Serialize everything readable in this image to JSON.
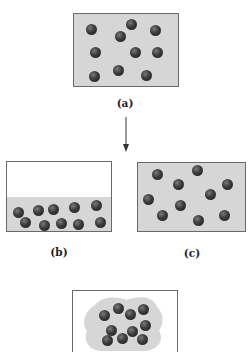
{
  "panels": [
    {
      "id": "a",
      "label": "(a)",
      "state": "gas filling container",
      "box": [
        73,
        13,
        106,
        74
      ],
      "fill": "full",
      "balls": [
        [
          91,
          29
        ],
        [
          131,
          24
        ],
        [
          120,
          36
        ],
        [
          155,
          30
        ],
        [
          95,
          52
        ],
        [
          135,
          52
        ],
        [
          157,
          52
        ],
        [
          94,
          76
        ],
        [
          118,
          70
        ],
        [
          146,
          75
        ]
      ]
    },
    {
      "id": "b",
      "label": "(b)",
      "state": "liquid at bottom of container",
      "box": [
        6,
        161,
        106,
        71
      ],
      "fill": "bottom",
      "fill_top": 196,
      "balls": [
        [
          18,
          212
        ],
        [
          38,
          210
        ],
        [
          53,
          209
        ],
        [
          74,
          207
        ],
        [
          96,
          205
        ],
        [
          25,
          222
        ],
        [
          44,
          225
        ],
        [
          61,
          223
        ],
        [
          78,
          224
        ],
        [
          100,
          222
        ]
      ]
    },
    {
      "id": "c",
      "label": "(c)",
      "state": "gas filling container",
      "box": [
        137,
        162,
        109,
        70
      ],
      "fill": "full",
      "balls": [
        [
          157,
          174
        ],
        [
          197,
          170
        ],
        [
          178,
          184
        ],
        [
          227,
          184
        ],
        [
          148,
          199
        ],
        [
          210,
          194
        ],
        [
          180,
          205
        ],
        [
          162,
          215
        ],
        [
          198,
          220
        ],
        [
          224,
          215
        ]
      ]
    },
    {
      "id": "d",
      "label": "",
      "state": "solid clustered",
      "box": [
        72,
        290,
        106,
        62
      ],
      "fill": "blob",
      "balls": [
        [
          104,
          315
        ],
        [
          118,
          308
        ],
        [
          130,
          314
        ],
        [
          143,
          309
        ],
        [
          111,
          330
        ],
        [
          132,
          331
        ],
        [
          145,
          325
        ],
        [
          107,
          340
        ],
        [
          122,
          338
        ],
        [
          142,
          339
        ]
      ]
    }
  ],
  "labels": {
    "a": "(a)",
    "b": "(b)",
    "c": "(c)"
  },
  "arrow": {
    "from": [
      126,
      117
    ],
    "to": [
      126,
      150
    ],
    "direction": "down"
  },
  "colors": {
    "fill": "#d6d6d6",
    "border": "#6a6a6a",
    "ball": "#2a2a2a"
  }
}
